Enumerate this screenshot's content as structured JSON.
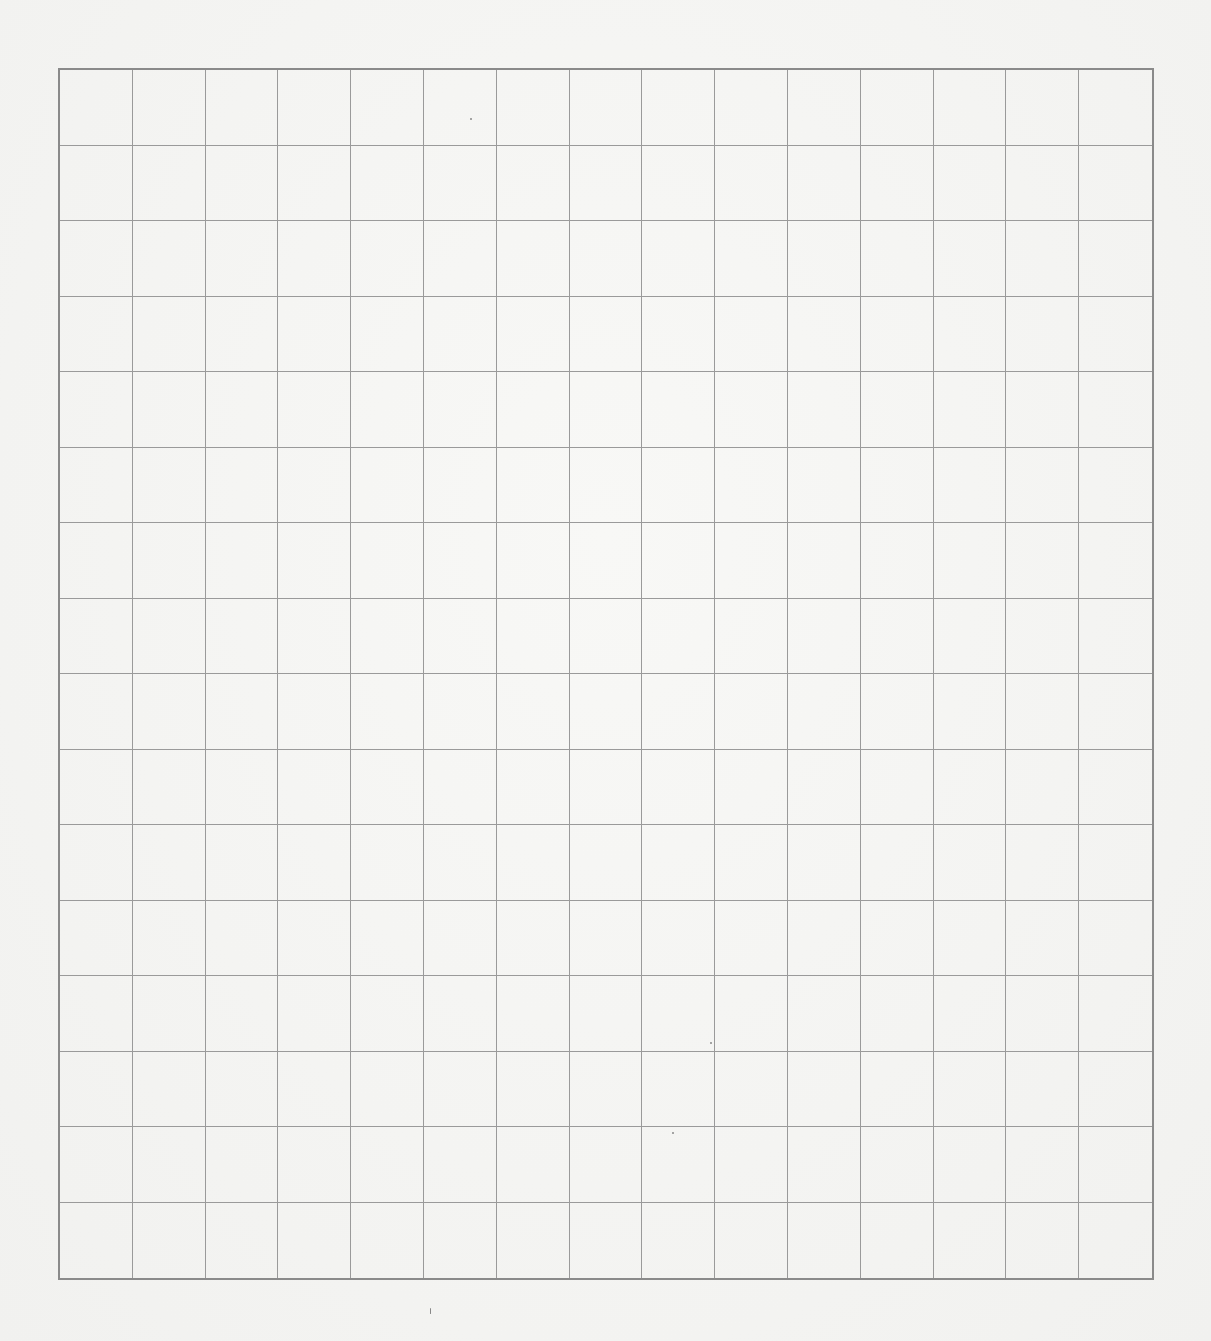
{
  "sheet": {
    "type": "grid-paper",
    "columns": 15,
    "rows": 16,
    "line_color": "#9a9a9a",
    "border_color": "#8a8a8a",
    "background": "#f4f4f2"
  }
}
